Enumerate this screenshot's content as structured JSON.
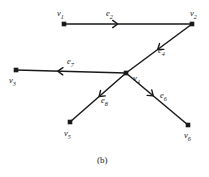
{
  "figure": {
    "caption": "(b)",
    "background": "#ffffff",
    "ink_color": "#1a1a1a",
    "width": 209,
    "height": 177
  },
  "chart_data": {
    "type": "diagram",
    "subtype": "directed-graph",
    "title": "(b)",
    "nodes": [
      {
        "id": "v1",
        "label": "v",
        "sub": "1",
        "x": 64,
        "y": 24,
        "label_x": 57,
        "label_y": 9
      },
      {
        "id": "v2",
        "label": "v",
        "sub": "2",
        "x": 192,
        "y": 24,
        "label_x": 190,
        "label_y": 9
      },
      {
        "id": "v3",
        "label": "v",
        "sub": "3",
        "x": 16,
        "y": 70,
        "label_x": 9,
        "label_y": 76
      },
      {
        "id": "v4",
        "label": "v",
        "sub": "4",
        "x": 126,
        "y": 73,
        "label_x": 133,
        "label_y": 74
      },
      {
        "id": "v5",
        "label": "v",
        "sub": "5",
        "x": 70,
        "y": 122,
        "label_x": 64,
        "label_y": 129
      },
      {
        "id": "v6",
        "label": "v",
        "sub": "6",
        "x": 188,
        "y": 125,
        "label_x": 184,
        "label_y": 131
      }
    ],
    "edges": [
      {
        "id": "e2",
        "label": "e",
        "sub": "2",
        "from": "v1",
        "to": "v2",
        "arrow_t": 0.42,
        "label_x": 106,
        "label_y": 9
      },
      {
        "id": "e4",
        "label": "e",
        "sub": "4",
        "from": "v2",
        "to": "v4",
        "arrow_t": 0.52,
        "label_x": 158,
        "label_y": 46
      },
      {
        "id": "e7",
        "label": "e",
        "sub": "7",
        "from": "v4",
        "to": "v3",
        "arrow_t": 0.62,
        "label_x": 67,
        "label_y": 57
      },
      {
        "id": "e8",
        "label": "e",
        "sub": "8",
        "from": "v4",
        "to": "v5",
        "arrow_t": 0.48,
        "label_x": 101,
        "label_y": 96
      },
      {
        "id": "e6",
        "label": "e",
        "sub": "6",
        "from": "v4",
        "to": "v6",
        "arrow_t": 0.44,
        "label_x": 160,
        "label_y": 91
      }
    ],
    "node_marker": "filled-square",
    "arrow_style": "open-chevron"
  }
}
